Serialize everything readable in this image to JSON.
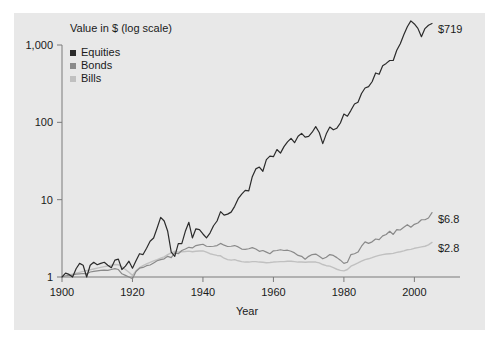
{
  "chart_data": {
    "type": "line",
    "title": "Value in $ (log scale)",
    "xlabel": "Year",
    "ylabel": "",
    "yscale": "log",
    "ylim": [
      1,
      1000
    ],
    "xlim": [
      1900,
      2005
    ],
    "grid": false,
    "legend_position": "top-left",
    "ytick_labels": [
      "1,000",
      "100",
      "10",
      "1"
    ],
    "ytick_values": [
      1000,
      100,
      10,
      1
    ],
    "xtick_labels": [
      "1900",
      "1920",
      "1940",
      "1960",
      "1980",
      "2000"
    ],
    "xtick_values": [
      1900,
      1920,
      1940,
      1960,
      1980,
      2000
    ],
    "end_labels": [
      {
        "series": "Equities",
        "text": "$719",
        "value": 719
      },
      {
        "series": "Bonds",
        "text": "$6.8",
        "value": 6.8
      },
      {
        "series": "Bills",
        "text": "$2.8",
        "value": 2.8
      }
    ],
    "series": [
      {
        "name": "Equities",
        "color": "#2b2b2b",
        "x": [
          1900,
          1901,
          1902,
          1903,
          1904,
          1905,
          1906,
          1907,
          1908,
          1909,
          1910,
          1911,
          1912,
          1913,
          1914,
          1915,
          1916,
          1917,
          1918,
          1919,
          1920,
          1921,
          1922,
          1923,
          1924,
          1925,
          1926,
          1927,
          1928,
          1929,
          1930,
          1931,
          1932,
          1933,
          1934,
          1935,
          1936,
          1937,
          1938,
          1939,
          1940,
          1941,
          1942,
          1943,
          1944,
          1945,
          1946,
          1947,
          1948,
          1949,
          1950,
          1951,
          1952,
          1953,
          1954,
          1955,
          1956,
          1957,
          1958,
          1959,
          1960,
          1961,
          1962,
          1963,
          1964,
          1965,
          1966,
          1967,
          1968,
          1969,
          1970,
          1971,
          1972,
          1973,
          1974,
          1975,
          1976,
          1977,
          1978,
          1979,
          1980,
          1981,
          1982,
          1983,
          1984,
          1985,
          1986,
          1987,
          1988,
          1989,
          1990,
          1991,
          1992,
          1993,
          1994,
          1995,
          1996,
          1997,
          1998,
          1999,
          2000,
          2001,
          2002,
          2003,
          2004,
          2005
        ],
        "values": [
          1.0,
          1.12,
          1.08,
          1.0,
          1.28,
          1.5,
          1.42,
          1.0,
          1.42,
          1.55,
          1.44,
          1.5,
          1.55,
          1.42,
          1.32,
          1.65,
          1.7,
          1.25,
          1.38,
          1.6,
          1.3,
          1.62,
          2.0,
          1.95,
          2.35,
          2.9,
          3.2,
          4.3,
          5.9,
          5.3,
          3.9,
          2.1,
          1.85,
          2.7,
          2.7,
          3.9,
          5.1,
          3.2,
          4.2,
          4.1,
          3.6,
          3.2,
          3.7,
          4.6,
          5.3,
          7.0,
          6.3,
          6.5,
          6.9,
          8.2,
          10.3,
          11.8,
          13.2,
          13.0,
          19.8,
          25.0,
          26.4,
          23.3,
          33.0,
          36.5,
          36.0,
          44.5,
          40.0,
          48.5,
          56.0,
          62.0,
          54.5,
          66.0,
          72.0,
          64.5,
          66.0,
          74.5,
          88.0,
          74.0,
          53.0,
          71.0,
          87.0,
          80.0,
          84.0,
          98.0,
          128.0,
          120.0,
          143.0,
          173.0,
          182.0,
          236.0,
          278.0,
          290.0,
          335.0,
          435.0,
          418.0,
          540.0,
          578.0,
          630.0,
          630.0,
          855.0,
          1040.0,
          1360.0,
          1720.0,
          2050.0,
          1870.0,
          1640.0,
          1280.0,
          1630.0,
          1800.0,
          1900.0
        ]
      },
      {
        "name": "Bonds",
        "color": "#8a8a8a",
        "x": [
          1900,
          1901,
          1902,
          1903,
          1904,
          1905,
          1906,
          1907,
          1908,
          1909,
          1910,
          1911,
          1912,
          1913,
          1914,
          1915,
          1916,
          1917,
          1918,
          1919,
          1920,
          1921,
          1922,
          1923,
          1924,
          1925,
          1926,
          1927,
          1928,
          1929,
          1930,
          1931,
          1932,
          1933,
          1934,
          1935,
          1936,
          1937,
          1938,
          1939,
          1940,
          1941,
          1942,
          1943,
          1944,
          1945,
          1946,
          1947,
          1948,
          1949,
          1950,
          1951,
          1952,
          1953,
          1954,
          1955,
          1956,
          1957,
          1958,
          1959,
          1960,
          1961,
          1962,
          1963,
          1964,
          1965,
          1966,
          1967,
          1968,
          1969,
          1970,
          1971,
          1972,
          1973,
          1974,
          1975,
          1976,
          1977,
          1978,
          1979,
          1980,
          1981,
          1982,
          1983,
          1984,
          1985,
          1986,
          1987,
          1988,
          1989,
          1990,
          1991,
          1992,
          1993,
          1994,
          1995,
          1996,
          1997,
          1998,
          1999,
          2000,
          2001,
          2002,
          2003,
          2004,
          2005
        ],
        "values": [
          1.0,
          1.03,
          1.05,
          1.06,
          1.09,
          1.1,
          1.11,
          1.1,
          1.16,
          1.18,
          1.2,
          1.22,
          1.23,
          1.22,
          1.25,
          1.28,
          1.25,
          1.1,
          1.05,
          1.0,
          0.95,
          1.18,
          1.3,
          1.33,
          1.4,
          1.43,
          1.52,
          1.62,
          1.68,
          1.72,
          1.85,
          1.78,
          2.05,
          2.0,
          2.2,
          2.3,
          2.42,
          2.38,
          2.55,
          2.6,
          2.65,
          2.5,
          2.48,
          2.5,
          2.55,
          2.72,
          2.58,
          2.48,
          2.5,
          2.55,
          2.45,
          2.3,
          2.28,
          2.32,
          2.4,
          2.3,
          2.15,
          2.2,
          2.1,
          2.0,
          2.18,
          2.2,
          2.25,
          2.2,
          2.22,
          2.15,
          2.05,
          1.9,
          1.85,
          1.7,
          1.85,
          1.95,
          1.98,
          1.85,
          1.72,
          1.8,
          1.95,
          1.9,
          1.78,
          1.65,
          1.5,
          1.55,
          1.95,
          2.0,
          2.1,
          2.5,
          2.85,
          2.72,
          2.85,
          3.1,
          3.05,
          3.4,
          3.55,
          3.9,
          3.55,
          4.1,
          4.05,
          4.4,
          4.75,
          4.4,
          4.8,
          5.0,
          5.5,
          5.5,
          5.8,
          6.8
        ]
      },
      {
        "name": "Bills",
        "color": "#c0c0c0",
        "x": [
          1900,
          1901,
          1902,
          1903,
          1904,
          1905,
          1906,
          1907,
          1908,
          1909,
          1910,
          1911,
          1912,
          1913,
          1914,
          1915,
          1916,
          1917,
          1918,
          1919,
          1920,
          1921,
          1922,
          1923,
          1924,
          1925,
          1926,
          1927,
          1928,
          1929,
          1930,
          1931,
          1932,
          1933,
          1934,
          1935,
          1936,
          1937,
          1938,
          1939,
          1940,
          1941,
          1942,
          1943,
          1944,
          1945,
          1946,
          1947,
          1948,
          1949,
          1950,
          1951,
          1952,
          1953,
          1954,
          1955,
          1956,
          1957,
          1958,
          1959,
          1960,
          1961,
          1962,
          1963,
          1964,
          1965,
          1966,
          1967,
          1968,
          1969,
          1970,
          1971,
          1972,
          1973,
          1974,
          1975,
          1976,
          1977,
          1978,
          1979,
          1980,
          1981,
          1982,
          1983,
          1984,
          1985,
          1986,
          1987,
          1988,
          1989,
          1990,
          1991,
          1992,
          1993,
          1994,
          1995,
          1996,
          1997,
          1998,
          1999,
          2000,
          2001,
          2002,
          2003,
          2004,
          2005
        ],
        "values": [
          1.0,
          1.03,
          1.06,
          1.09,
          1.12,
          1.15,
          1.18,
          1.21,
          1.24,
          1.27,
          1.3,
          1.33,
          1.36,
          1.39,
          1.42,
          1.45,
          1.44,
          1.35,
          1.25,
          1.15,
          1.05,
          1.2,
          1.32,
          1.4,
          1.48,
          1.55,
          1.62,
          1.68,
          1.75,
          1.82,
          1.95,
          2.05,
          2.15,
          2.1,
          2.12,
          2.14,
          2.16,
          2.12,
          2.15,
          2.17,
          2.18,
          2.1,
          2.0,
          1.95,
          1.9,
          1.88,
          1.75,
          1.68,
          1.65,
          1.68,
          1.62,
          1.58,
          1.56,
          1.56,
          1.58,
          1.58,
          1.56,
          1.55,
          1.53,
          1.54,
          1.56,
          1.57,
          1.58,
          1.58,
          1.6,
          1.6,
          1.58,
          1.56,
          1.56,
          1.55,
          1.56,
          1.57,
          1.56,
          1.52,
          1.45,
          1.4,
          1.38,
          1.32,
          1.26,
          1.22,
          1.2,
          1.25,
          1.38,
          1.45,
          1.52,
          1.6,
          1.68,
          1.72,
          1.78,
          1.85,
          1.9,
          1.95,
          1.98,
          2.0,
          2.02,
          2.08,
          2.12,
          2.18,
          2.25,
          2.28,
          2.35,
          2.4,
          2.45,
          2.5,
          2.6,
          2.8
        ]
      }
    ]
  },
  "legend": {
    "items": [
      {
        "label": "Equities",
        "color": "#2b2b2b"
      },
      {
        "label": "Bonds",
        "color": "#8a8a8a"
      },
      {
        "label": "Bills",
        "color": "#c0c0c0"
      }
    ]
  }
}
